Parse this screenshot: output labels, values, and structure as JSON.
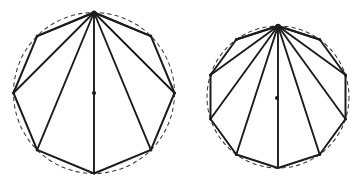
{
  "figure": {
    "background_color": "#ffffff",
    "line_color": "#1c1c1c",
    "dashed_circle_color": "#3a3a3a",
    "canvas": {
      "width": 353,
      "height": 189
    }
  },
  "shapes": [
    {
      "id": "left-figure",
      "name": "octagon-inscribed-in-circle",
      "polygon_sides": 8,
      "polygon_name": "octagon",
      "circle": {
        "cx": 94,
        "cy": 93,
        "r": 80.5,
        "style": "dashed"
      },
      "apex": {
        "x": 94,
        "y": 12.5
      },
      "center_dot": {
        "x": 94,
        "y": 93,
        "r": 2.1
      },
      "rotation_deg": -90,
      "vertices": [
        {
          "x": 94.0,
          "y": 12.5
        },
        {
          "x": 150.9,
          "y": 36.1
        },
        {
          "x": 174.5,
          "y": 93.0
        },
        {
          "x": 150.9,
          "y": 149.9
        },
        {
          "x": 94.0,
          "y": 173.5
        },
        {
          "x": 37.1,
          "y": 149.9
        },
        {
          "x": 13.5,
          "y": 93.0
        },
        {
          "x": 37.1,
          "y": 36.1
        }
      ],
      "fan_diagonals": 5,
      "fan_targets": [
        1,
        2,
        3,
        4,
        5,
        6,
        7
      ],
      "diameter_line": {
        "from": 0,
        "to": 4
      }
    },
    {
      "id": "right-figure",
      "name": "decagon-inscribed-in-circle",
      "polygon_sides": 10,
      "polygon_name": "decagon",
      "circle": {
        "cx": 278,
        "cy": 97,
        "r": 71.0,
        "style": "dashed"
      },
      "apex": {
        "x": 278,
        "y": 26.0
      },
      "center_dot": {
        "x": 277,
        "y": 98,
        "r": 2.1
      },
      "rotation_deg": -90,
      "vertices": [
        {
          "x": 278.0,
          "y": 26.0
        },
        {
          "x": 319.7,
          "y": 39.5
        },
        {
          "x": 345.5,
          "y": 75.0
        },
        {
          "x": 345.5,
          "y": 119.0
        },
        {
          "x": 319.7,
          "y": 154.5
        },
        {
          "x": 278.0,
          "y": 168.0
        },
        {
          "x": 236.3,
          "y": 154.5
        },
        {
          "x": 210.5,
          "y": 119.0
        },
        {
          "x": 210.5,
          "y": 75.0
        },
        {
          "x": 236.3,
          "y": 39.5
        }
      ],
      "fan_diagonals": 7,
      "fan_targets": [
        1,
        2,
        3,
        4,
        5,
        6,
        7,
        8,
        9
      ]
    }
  ]
}
